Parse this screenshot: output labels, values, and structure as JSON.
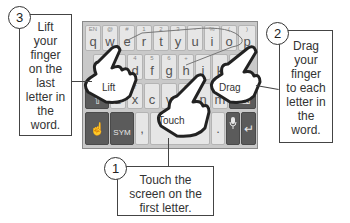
{
  "keyboard": {
    "row1": [
      {
        "key": "q",
        "sub": "EN"
      },
      {
        "key": "w",
        "sub": "@"
      },
      {
        "key": "e",
        "sub": "#"
      },
      {
        "key": "r",
        "sub": "1"
      },
      {
        "key": "t",
        "sub": "2"
      },
      {
        "key": "y",
        "sub": "3"
      },
      {
        "key": "u",
        "sub": "-"
      },
      {
        "key": "i",
        "sub": "%"
      },
      {
        "key": "o",
        "sub": "("
      },
      {
        "key": "p",
        "sub": ")"
      }
    ],
    "row2": [
      {
        "key": "a",
        "sub": ""
      },
      {
        "key": "s",
        "sub": ""
      },
      {
        "key": "d",
        "sub": "4"
      },
      {
        "key": "f",
        "sub": "5"
      },
      {
        "key": "g",
        "sub": "6"
      },
      {
        "key": "h",
        "sub": "+"
      },
      {
        "key": "j",
        "sub": ""
      },
      {
        "key": "k",
        "sub": ""
      },
      {
        "key": "l",
        "sub": ""
      }
    ],
    "row3": [
      {
        "key": "z",
        "sub": ""
      },
      {
        "key": "x",
        "sub": "7"
      },
      {
        "key": "c",
        "sub": ""
      },
      {
        "key": "v",
        "sub": ""
      },
      {
        "key": "b",
        "sub": "0"
      },
      {
        "key": "n",
        "sub": ""
      },
      {
        "key": "m",
        "sub": ""
      }
    ],
    "shift_label": "⇧",
    "backspace_label": "⌫",
    "swype_label": "☝",
    "sym_label": "SYM",
    "comma_label": ",",
    "period_label": ".",
    "mic_label": "🎤",
    "enter_label": "↵"
  },
  "hands": {
    "lift": "Lift",
    "touch": "Touch",
    "drag": "Drag"
  },
  "callouts": [
    {
      "number": "1",
      "lines": [
        "Touch the",
        "screen on the",
        "first letter."
      ]
    },
    {
      "number": "2",
      "lines": [
        "Drag",
        "your",
        "finger",
        "to each",
        "letter in",
        "the",
        "word."
      ]
    },
    {
      "number": "3",
      "lines": [
        "Lift",
        "your",
        "finger",
        "on the",
        "last",
        "letter in",
        "the",
        "word."
      ]
    }
  ]
}
